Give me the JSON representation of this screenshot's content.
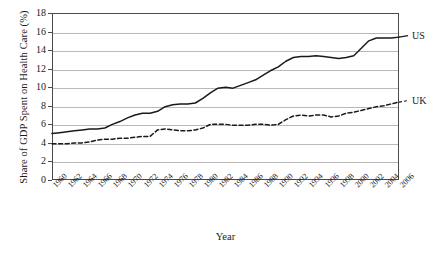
{
  "chart_data": {
    "type": "line",
    "title": "",
    "xlabel": "Year",
    "ylabel": "Share of GDP Spent on Health Care (%)",
    "xlim": [
      1960,
      2006
    ],
    "ylim": [
      0,
      18
    ],
    "ytick_labels": [
      "0",
      "2",
      "4",
      "6",
      "8",
      "10",
      "12",
      "14",
      "16",
      "18"
    ],
    "ytick_values": [
      0,
      2,
      4,
      6,
      8,
      10,
      12,
      14,
      16,
      18
    ],
    "grid": true,
    "legend_position": "right-inline",
    "x": [
      1960,
      1961,
      1962,
      1963,
      1964,
      1965,
      1966,
      1967,
      1968,
      1969,
      1970,
      1971,
      1972,
      1973,
      1974,
      1975,
      1976,
      1977,
      1978,
      1979,
      1980,
      1981,
      1982,
      1983,
      1984,
      1985,
      1986,
      1987,
      1988,
      1989,
      1990,
      1991,
      1992,
      1993,
      1994,
      1995,
      1996,
      1997,
      1998,
      1999,
      2000,
      2001,
      2002,
      2003,
      2004,
      2005,
      2006
    ],
    "xtick_labels": [
      "1960",
      "1962",
      "1964",
      "1966",
      "1968",
      "1970",
      "1972",
      "1974",
      "1976",
      "1978",
      "1980",
      "1982",
      "1984",
      "1986",
      "1988",
      "1990",
      "1992",
      "1994",
      "1996",
      "1998",
      "2000",
      "2002",
      "2004",
      "2006"
    ],
    "series": [
      {
        "name": "US",
        "style": "solid",
        "color": "#1a1a1a",
        "values": [
          5.0,
          5.1,
          5.2,
          5.3,
          5.4,
          5.5,
          5.5,
          5.6,
          6.0,
          6.3,
          6.7,
          7.0,
          7.2,
          7.2,
          7.4,
          7.9,
          8.1,
          8.2,
          8.2,
          8.3,
          8.8,
          9.4,
          9.9,
          10.0,
          9.9,
          10.2,
          10.5,
          10.8,
          11.3,
          11.8,
          12.2,
          12.8,
          13.2,
          13.3,
          13.3,
          13.4,
          13.3,
          13.2,
          13.1,
          13.2,
          13.4,
          14.2,
          15.0,
          15.3,
          15.3,
          15.3,
          15.4
        ]
      },
      {
        "name": "UK",
        "style": "dashed",
        "color": "#1a1a1a",
        "values": [
          3.9,
          3.9,
          3.9,
          4.0,
          4.0,
          4.1,
          4.3,
          4.4,
          4.4,
          4.5,
          4.5,
          4.6,
          4.7,
          4.7,
          5.4,
          5.5,
          5.4,
          5.3,
          5.3,
          5.4,
          5.6,
          6.0,
          6.0,
          6.0,
          5.9,
          5.9,
          5.9,
          6.0,
          6.0,
          5.9,
          6.0,
          6.5,
          6.9,
          7.0,
          6.9,
          7.0,
          7.0,
          6.8,
          6.9,
          7.2,
          7.3,
          7.5,
          7.7,
          7.9,
          8.0,
          8.2,
          8.4
        ]
      }
    ]
  }
}
